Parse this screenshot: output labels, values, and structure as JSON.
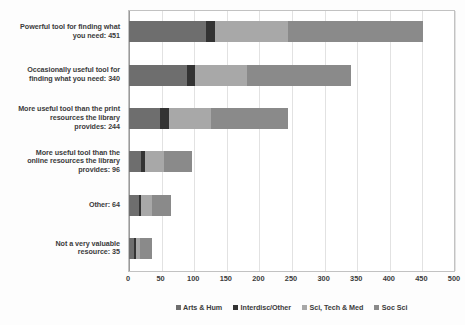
{
  "chart_data": {
    "type": "bar",
    "orientation": "horizontal",
    "stacked": true,
    "title": "",
    "subtitle": "",
    "xlabel": "",
    "ylabel": "",
    "xlim": [
      0,
      500
    ],
    "xticks": [
      0,
      50,
      100,
      150,
      200,
      250,
      300,
      350,
      400,
      450,
      500
    ],
    "xtick_labels": [
      "0",
      "50",
      "100",
      "150",
      "200",
      "250",
      "300",
      "350",
      "400",
      "450",
      "500"
    ],
    "grid": true,
    "grid_axis": "x",
    "legend_position": "bottom",
    "categories": [
      "Powerful tool for finding what you need: 451",
      "Occasionally useful tool for finding what you need: 340",
      "More useful tool than the print resources the library provides: 244",
      "More useful tool than the online resources the library provides: 96",
      "Other: 64",
      "Not a very valuable resource: 35"
    ],
    "category_totals": [
      451,
      340,
      244,
      96,
      64,
      35
    ],
    "series": [
      {
        "name": "Arts & Hum",
        "color": "#6e6e6e",
        "values": [
          118,
          89,
          48,
          19,
          15,
          8
        ]
      },
      {
        "name": "Interdisc/Other",
        "color": "#333333",
        "values": [
          14,
          12,
          13,
          6,
          4,
          3
        ]
      },
      {
        "name": "Sci, Tech & Med",
        "color": "#a8a8a8",
        "values": [
          112,
          80,
          65,
          28,
          17,
          6
        ]
      },
      {
        "name": "Soc Sci",
        "color": "#8a8a8a",
        "values": [
          207,
          159,
          118,
          43,
          28,
          18
        ]
      }
    ]
  },
  "category_label_lines": [
    [
      "Powerful tool for finding what",
      "you need: 451"
    ],
    [
      "Occasionally useful tool for",
      "finding what you need: 340"
    ],
    [
      "More useful tool than the print",
      "resources the library",
      "provides: 244"
    ],
    [
      "More useful tool than the",
      "online resources the library",
      "provides: 96"
    ],
    [
      "Other: 64"
    ],
    [
      "Not a very valuable",
      "resource: 35"
    ]
  ],
  "legend": {
    "items": [
      {
        "label": "Arts & Hum",
        "color": "#6e6e6e"
      },
      {
        "label": "Interdisc/Other",
        "color": "#333333"
      },
      {
        "label": "Sci, Tech & Med",
        "color": "#a8a8a8"
      },
      {
        "label": "Soc Sci",
        "color": "#8a8a8a"
      }
    ]
  }
}
